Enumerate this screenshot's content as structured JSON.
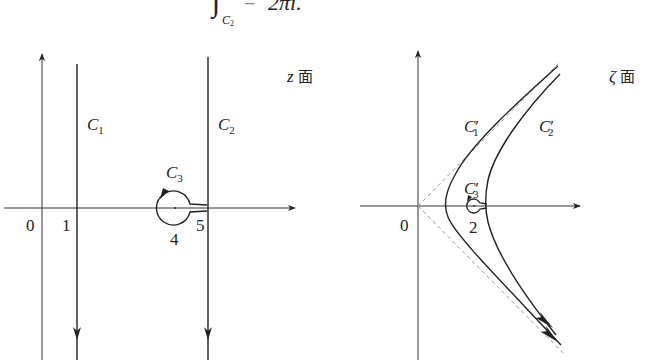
{
  "formula": {
    "integral_sign": "∫",
    "subscript_var": "C",
    "subscript_idx": "2",
    "middle": "=",
    "rhs": "2πi."
  },
  "z_plane": {
    "plane_var": "z",
    "plane_word": "面",
    "origin_label": "0",
    "tick_1": "1",
    "tick_4": "4",
    "tick_5": "5",
    "c1": {
      "letter": "C",
      "idx": "1"
    },
    "c2": {
      "letter": "C",
      "idx": "2"
    },
    "c3": {
      "letter": "C",
      "idx": "3"
    }
  },
  "zeta_plane": {
    "plane_var": "ζ",
    "plane_word": "面",
    "origin_label": "0",
    "tick_2": "2",
    "c1p": {
      "letter": "C",
      "idx": "1",
      "prime": "′"
    },
    "c2p": {
      "letter": "C",
      "idx": "2",
      "prime": "′"
    },
    "c3p": {
      "letter": "C",
      "idx": "3",
      "prime": "′"
    }
  },
  "colors": {
    "ink": "#222222",
    "dashed": "#9a9a9a"
  }
}
